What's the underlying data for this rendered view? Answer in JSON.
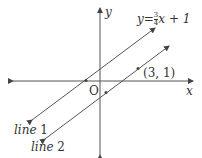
{
  "diagram": {
    "type": "coordinate-plane",
    "axes": {
      "x_label": "x",
      "y_label": "y",
      "origin_label": "O"
    },
    "equation": {
      "lhs": "y",
      "equals": "=",
      "frac_num": "3",
      "frac_den": "4",
      "rhs_tail": "x + 1"
    },
    "point_label": "(3, 1)",
    "lines": [
      {
        "name": "line 1",
        "word": "line",
        "num": "1",
        "equation": "y = 3/4 x + 1"
      },
      {
        "name": "line 2",
        "word": "line",
        "num": "2",
        "through": "(3, 1)",
        "parallel_to": "line 1"
      }
    ],
    "colors": {
      "stroke": "#555555",
      "text": "#333333"
    }
  }
}
